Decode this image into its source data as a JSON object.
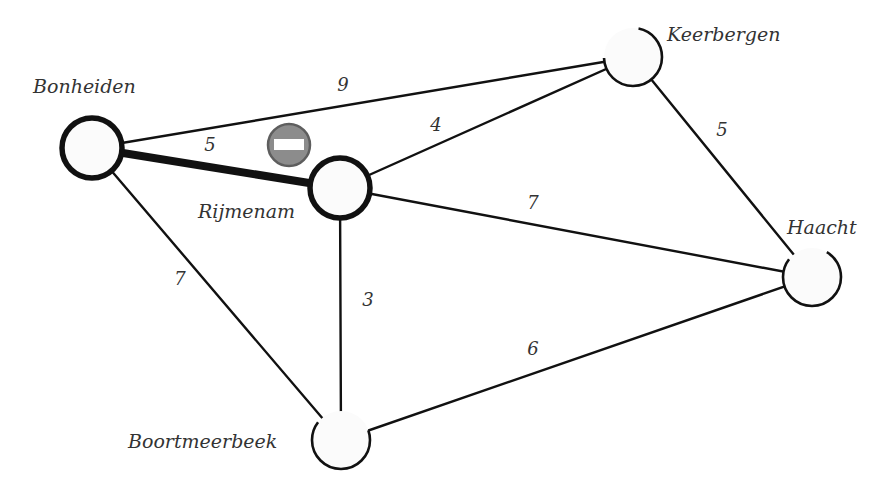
{
  "diagram": {
    "type": "weighted-graph",
    "nodes": [
      {
        "id": "bonheiden",
        "label": "Bonheiden",
        "cx": 92,
        "cy": 148,
        "r": 30,
        "emphasized": true,
        "label_x": 33,
        "label_y": 93
      },
      {
        "id": "rijmenam",
        "label": "Rijmenam",
        "cx": 340,
        "cy": 188,
        "r": 30,
        "emphasized": true,
        "label_x": 198,
        "label_y": 218
      },
      {
        "id": "keerbergen",
        "label": "Keerbergen",
        "cx": 633,
        "cy": 57,
        "r": 29,
        "emphasized": false,
        "label_x": 667,
        "label_y": 41
      },
      {
        "id": "haacht",
        "label": "Haacht",
        "cx": 812,
        "cy": 277,
        "r": 29,
        "emphasized": false,
        "label_x": 787,
        "label_y": 234
      },
      {
        "id": "boortmeerbeek",
        "label": "Boortmeerbeek",
        "cx": 341,
        "cy": 440,
        "r": 29,
        "emphasized": false,
        "label_x": 128,
        "label_y": 448
      }
    ],
    "edges": [
      {
        "from": "bonheiden",
        "to": "keerbergen",
        "weight": "9",
        "label_x": 343,
        "label_y": 91,
        "highlighted": false
      },
      {
        "from": "bonheiden",
        "to": "rijmenam",
        "weight": "5",
        "label_x": 210,
        "label_y": 151,
        "highlighted": true
      },
      {
        "from": "rijmenam",
        "to": "keerbergen",
        "weight": "4",
        "label_x": 436,
        "label_y": 131,
        "highlighted": false
      },
      {
        "from": "keerbergen",
        "to": "haacht",
        "weight": "5",
        "label_x": 722,
        "label_y": 136,
        "highlighted": false
      },
      {
        "from": "rijmenam",
        "to": "haacht",
        "weight": "7",
        "label_x": 533,
        "label_y": 209,
        "highlighted": false
      },
      {
        "from": "bonheiden",
        "to": "boortmeerbeek",
        "weight": "7",
        "label_x": 180,
        "label_y": 285,
        "highlighted": false
      },
      {
        "from": "rijmenam",
        "to": "boortmeerbeek",
        "weight": "3",
        "label_x": 368,
        "label_y": 306,
        "highlighted": false
      },
      {
        "from": "boortmeerbeek",
        "to": "haacht",
        "weight": "6",
        "label_x": 533,
        "label_y": 355,
        "highlighted": false
      }
    ],
    "blocked_marker": {
      "icon": "no-entry-icon",
      "cx": 289,
      "cy": 145,
      "r": 22,
      "on_edge": "bonheiden-rijmenam"
    },
    "colors": {
      "stroke": "#111111",
      "node_fill": "#fbfbfb",
      "label": "#333333",
      "no_entry_fill": "#8c8c8c",
      "no_entry_bar": "#ffffff"
    }
  }
}
